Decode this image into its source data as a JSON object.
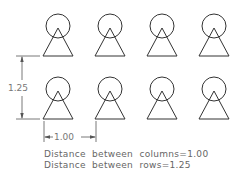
{
  "drawing": {
    "stroke_color": "#333333",
    "dim_color": "#555555",
    "columns_x": [
      58,
      110,
      162,
      214
    ],
    "rows_y": [
      56,
      119
    ],
    "circle_radius": 12,
    "triangle_half_width": 15,
    "triangle_height": 28
  },
  "dimensions": {
    "row_spacing_label": "1.25",
    "column_spacing_label": "1.00"
  },
  "notes": {
    "line1": "Distance  between  columns=1.00",
    "line2": "Distance  between  rows=1.25"
  }
}
